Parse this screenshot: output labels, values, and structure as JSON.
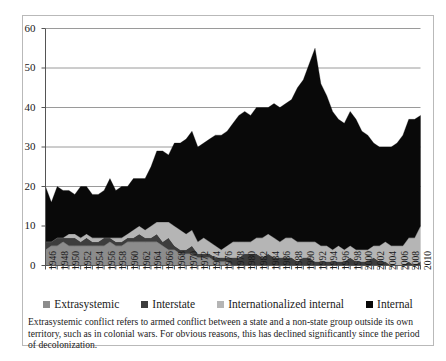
{
  "chart_data": {
    "type": "area",
    "title": "",
    "xlabel": "",
    "ylabel": "",
    "ylim": [
      0,
      60
    ],
    "ytick_step": 10,
    "yticks": [
      0,
      10,
      20,
      30,
      40,
      50,
      60
    ],
    "grid": true,
    "stacked": true,
    "legend_position": "bottom",
    "x": [
      1946,
      1947,
      1948,
      1949,
      1950,
      1951,
      1952,
      1953,
      1954,
      1955,
      1956,
      1957,
      1958,
      1959,
      1960,
      1961,
      1962,
      1963,
      1964,
      1965,
      1966,
      1967,
      1968,
      1969,
      1970,
      1971,
      1972,
      1973,
      1974,
      1975,
      1976,
      1977,
      1978,
      1979,
      1980,
      1981,
      1982,
      1983,
      1984,
      1985,
      1986,
      1987,
      1988,
      1989,
      1990,
      1991,
      1992,
      1993,
      1994,
      1995,
      1996,
      1997,
      1998,
      1999,
      2000,
      2001,
      2002,
      2003,
      2004,
      2005,
      2006,
      2007,
      2008,
      2009,
      2010
    ],
    "xtick_labels": [
      "1946",
      "1948",
      "1950",
      "1952",
      "1954",
      "1956",
      "1958",
      "1960",
      "1962",
      "1964",
      "1966",
      "1968",
      "1970",
      "1972",
      "1974",
      "1976",
      "1978",
      "1980",
      "1982",
      "1984",
      "1986",
      "1988",
      "1990",
      "1992",
      "1994",
      "1996",
      "1998",
      "2000",
      "2002",
      "2004",
      "2006",
      "2008",
      "2010"
    ],
    "series": [
      {
        "name": "Extrasystemic",
        "color": "#8c8c8c",
        "values": [
          4,
          5,
          5,
          6,
          5,
          5,
          5,
          5,
          5,
          5,
          5,
          6,
          5,
          5,
          6,
          6,
          6,
          6,
          6,
          6,
          5,
          4,
          4,
          3,
          3,
          3,
          2,
          2,
          2,
          1,
          1,
          1,
          0,
          0,
          0,
          0,
          0,
          0,
          0,
          0,
          0,
          0,
          0,
          0,
          0,
          0,
          0,
          0,
          0,
          0,
          0,
          0,
          0,
          0,
          0,
          0,
          0,
          0,
          0,
          0,
          0,
          0,
          0,
          0,
          0
        ]
      },
      {
        "name": "Interstate",
        "color": "#3d3d3d",
        "values": [
          2,
          1,
          2,
          1,
          2,
          2,
          1,
          2,
          1,
          1,
          2,
          1,
          1,
          1,
          1,
          1,
          2,
          1,
          1,
          2,
          1,
          3,
          1,
          1,
          1,
          2,
          1,
          1,
          1,
          1,
          1,
          1,
          2,
          2,
          3,
          3,
          3,
          2,
          3,
          2,
          2,
          2,
          2,
          1,
          2,
          2,
          1,
          1,
          1,
          1,
          1,
          1,
          2,
          1,
          1,
          1,
          2,
          1,
          1,
          0,
          0,
          0,
          1,
          0,
          1
        ]
      },
      {
        "name": "Internationalized internal",
        "color": "#b5b5b5",
        "values": [
          0,
          0,
          0,
          0,
          1,
          1,
          1,
          1,
          1,
          1,
          0,
          0,
          1,
          1,
          1,
          2,
          2,
          2,
          3,
          3,
          5,
          4,
          5,
          5,
          4,
          4,
          3,
          4,
          3,
          3,
          2,
          3,
          4,
          4,
          3,
          3,
          4,
          5,
          5,
          5,
          4,
          5,
          5,
          5,
          4,
          4,
          5,
          4,
          4,
          3,
          4,
          3,
          3,
          3,
          3,
          3,
          3,
          4,
          5,
          5,
          5,
          5,
          6,
          7,
          9
        ]
      },
      {
        "name": "Internal",
        "color": "#090909",
        "values": [
          14,
          10,
          13,
          12,
          11,
          10,
          13,
          12,
          11,
          11,
          12,
          15,
          12,
          13,
          12,
          13,
          12,
          13,
          15,
          18,
          18,
          17,
          21,
          22,
          24,
          25,
          24,
          24,
          26,
          28,
          29,
          29,
          30,
          32,
          33,
          32,
          33,
          33,
          32,
          34,
          34,
          34,
          35,
          39,
          41,
          45,
          49,
          41,
          38,
          35,
          32,
          32,
          34,
          33,
          30,
          29,
          26,
          25,
          24,
          25,
          26,
          28,
          30,
          30,
          28
        ]
      }
    ]
  },
  "axes": {
    "y_min_label": "0",
    "y_max_label": "60"
  },
  "legend": {
    "items": [
      {
        "label": "Extrasystemic",
        "color": "#8c8c8c"
      },
      {
        "label": "Interstate",
        "color": "#3d3d3d"
      },
      {
        "label": "Internationalized internal",
        "color": "#b5b5b5"
      },
      {
        "label": "Internal",
        "color": "#090909"
      }
    ]
  },
  "caption": {
    "text": "Extrasystemic conflict refers to armed conflict between a state and a non-state group outside its own territory, such as in colonial wars. For obvious reasons, this has declined significantly since the period of decolonization."
  }
}
